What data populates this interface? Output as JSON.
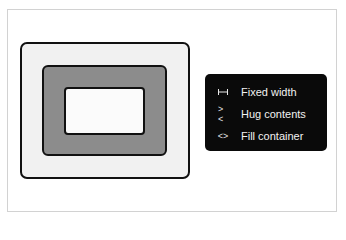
{
  "diagram": {
    "layers": [
      {
        "name": "outer-frame",
        "fill": "#f1f1f1"
      },
      {
        "name": "middle-frame",
        "fill": "#8c8c8c"
      },
      {
        "name": "inner-frame",
        "fill": "#fbfbfb"
      }
    ]
  },
  "menu": {
    "items": [
      {
        "icon": "fixed-width-icon",
        "label": "Fixed width"
      },
      {
        "icon": "hug-contents-icon",
        "label": "Hug contents",
        "glyph": "><"
      },
      {
        "icon": "fill-container-icon",
        "label": "Fill container",
        "glyph": "<>"
      }
    ]
  }
}
